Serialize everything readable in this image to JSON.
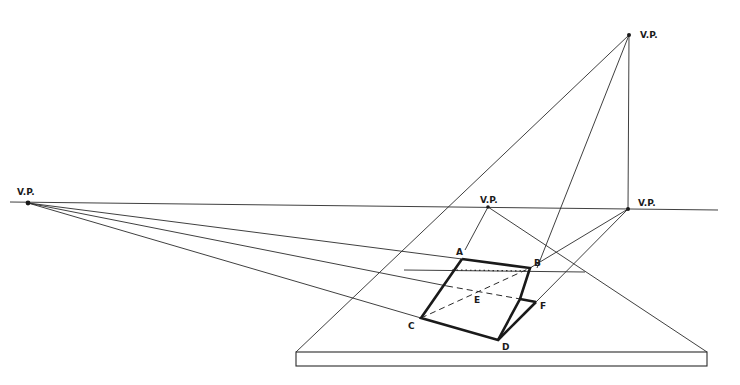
{
  "diagram": {
    "title": "",
    "vanishing_points": [
      {
        "id": "vp-left",
        "label": "V.P.",
        "x": 28,
        "y": 203
      },
      {
        "id": "vp-top",
        "label": "V.P.",
        "x": 629,
        "y": 35
      },
      {
        "id": "vp-center",
        "label": "V.P.",
        "x": 488,
        "y": 207
      },
      {
        "id": "vp-right",
        "label": "V.P.",
        "x": 628,
        "y": 209
      }
    ],
    "points": [
      {
        "label": "A",
        "x": 462,
        "y": 259
      },
      {
        "label": "B",
        "x": 530,
        "y": 268
      },
      {
        "label": "C",
        "x": 421,
        "y": 318
      },
      {
        "label": "D",
        "x": 498,
        "y": 340
      },
      {
        "label": "E",
        "x": 474,
        "y": 295
      },
      {
        "label": "F",
        "x": 536,
        "y": 302
      }
    ],
    "horizon_line": {
      "x1": 10,
      "y1": 202,
      "x2": 718,
      "y2": 210
    },
    "base_slab": {
      "left": 296,
      "right": 707,
      "top": 352,
      "bottom": 366
    }
  }
}
